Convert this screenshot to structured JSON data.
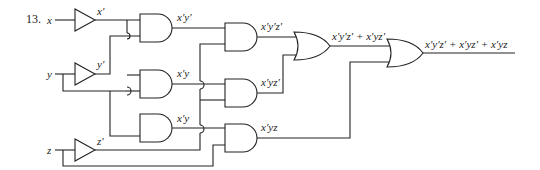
{
  "problem_number": "13.",
  "inputs": {
    "x": "x",
    "y": "y",
    "z": "z"
  },
  "inverters": {
    "x_not": "x′",
    "y_not": "y′",
    "z_not": "z′"
  },
  "and_level1": {
    "g1": "x′y′",
    "g2": "x′y",
    "g3": "x′y"
  },
  "and_level2": {
    "g4": "x′y′z′",
    "g5": "x′yz′",
    "g6": "x′yz"
  },
  "or_level1": {
    "g7": "x′y′z′ + x′yz′"
  },
  "output": {
    "g8": "x′y′z′ + x′yz′ + x′yz"
  }
}
